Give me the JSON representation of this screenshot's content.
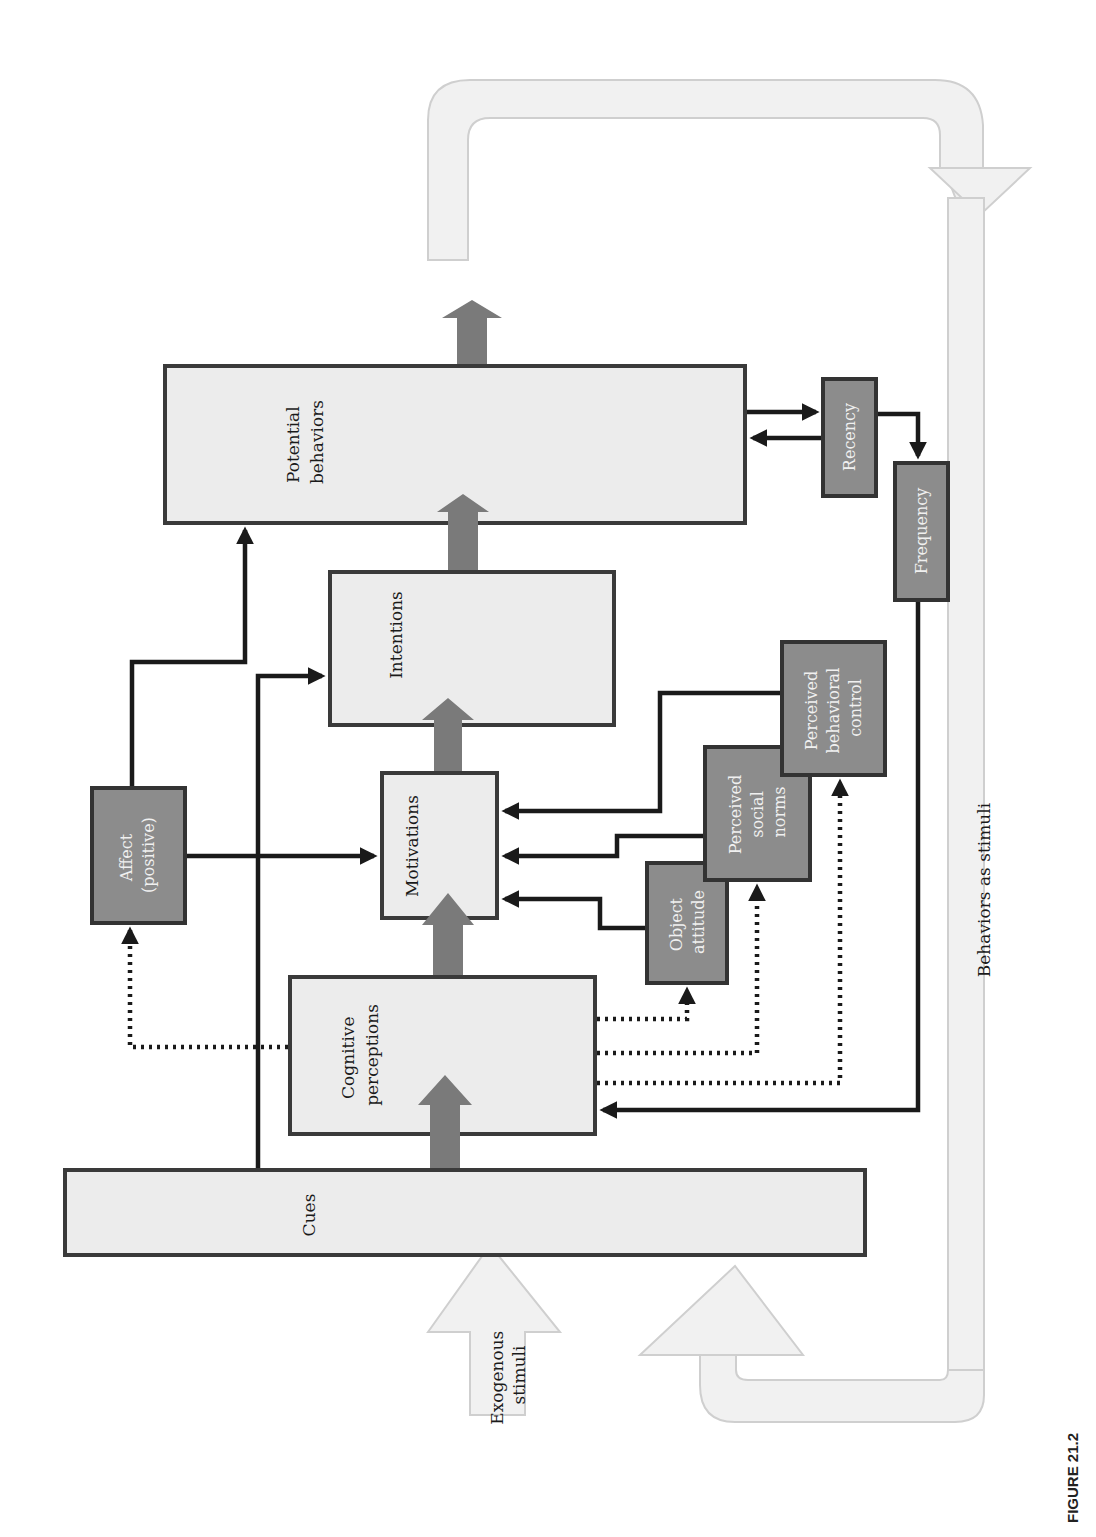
{
  "figure": {
    "caption": "FIGURE 21.2",
    "orientation": "rotated-90-ccw"
  },
  "nodes": {
    "cues": {
      "label": "Cues"
    },
    "cognitive_perceptions": {
      "line1": "Cognitive",
      "line2": "perceptions"
    },
    "motivations": {
      "label": "Motivations"
    },
    "intentions": {
      "label": "Intentions"
    },
    "potential_behaviors": {
      "line1": "Potential",
      "line2": "behaviors"
    },
    "affect": {
      "line1": "Affect",
      "line2": "(positive)"
    },
    "object_attitude": {
      "line1": "Object",
      "line2": "attitude"
    },
    "perceived_social_norms": {
      "line1": "Perceived",
      "line2": "social",
      "line3": "norms"
    },
    "perceived_behavioral_control": {
      "line1": "Perceived",
      "line2": "behavioral",
      "line3": "control"
    },
    "recency": {
      "label": "Recency"
    },
    "frequency": {
      "label": "Frequency"
    }
  },
  "flows": {
    "exogenous_stimuli": {
      "line1": "Exogenous",
      "line2": "stimuli"
    },
    "behaviors_as_stimuli": {
      "label": "Behaviors as stimuli"
    }
  },
  "colors": {
    "light_box": "#ececec",
    "dark_box": "#8c8c8c",
    "big_arrow": "#7a7a7a",
    "loop_arrow": "#f1f1f1",
    "line": "#1a1a1a"
  }
}
